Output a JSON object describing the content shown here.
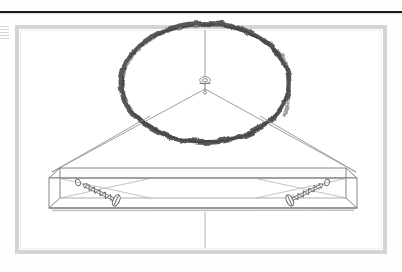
{
  "document": {
    "kind": "scanned-assembly-instruction-page",
    "title": "Hanging Shelf Mounting Diagram",
    "background_color": "#fefefe",
    "ink_color": "#7a7a7a",
    "annotation_color": "#4a4a4a",
    "rule_color": "#1c1c1c",
    "frame_color": "#d2d2d2"
  },
  "header_rule": {
    "name": "top-horizontal-rule",
    "x1": 0,
    "y1": 12,
    "x2": 402,
    "y2": 12,
    "thickness": 2.2,
    "color": "#1c1c1c"
  },
  "margin_marks": {
    "name": "left-margin-fragment",
    "visible": true,
    "lines": 5,
    "color": "#8d8d8d"
  },
  "illustration_frame": {
    "name": "illustration-border",
    "x": 17,
    "y": 27,
    "width": 368,
    "height": 225,
    "border_width": 4,
    "border_color": "#d4d4d4",
    "inner_fill": "#ffffff"
  },
  "annotation_circle": {
    "name": "hand-drawn-highlight-circle",
    "description": "dark hand-drawn ellipse encircling the suspension hook",
    "center_x": 205,
    "center_y": 83,
    "radius_x": 84,
    "radius_y": 60,
    "stroke_color": "#4d4d4d",
    "stroke_width": 5
  },
  "suspension": {
    "name": "suspension-assembly",
    "cable_color": "#8a8a8a",
    "vertical_cable": {
      "x": 205,
      "y_top": 30,
      "y_bottom": 78
    },
    "hook_fitting": {
      "name": "eye-bolt-fitting",
      "center_x": 205,
      "center_y": 81,
      "ring_rx": 5.2,
      "ring_ry": 3.6,
      "shaft_length": 12
    },
    "left_cable": {
      "x1": 205,
      "y1": 88,
      "x2": 52,
      "y2": 172
    },
    "right_cable": {
      "x1": 205,
      "y1": 88,
      "x2": 356,
      "y2": 172
    },
    "drop_line": {
      "x": 205,
      "y_top": 212,
      "y_bottom": 248
    }
  },
  "board": {
    "name": "shelf-board",
    "description": "isometric rectangular board viewed from slightly below",
    "front_face": {
      "x": 49,
      "y": 178,
      "width": 308,
      "height": 30
    },
    "top_face_depth": 10,
    "left_end_x": 49,
    "right_end_x": 357,
    "top_y": 168,
    "bottom_y": 209,
    "stroke_color": "#7d7d7d",
    "stroke_width": 0.9
  },
  "screws": [
    {
      "name": "screw-left",
      "pilot_hole_x": 78,
      "pilot_hole_y": 182,
      "head_x": 117,
      "head_y": 201,
      "tip_x": 86,
      "tip_y": 185,
      "angle_deg": 26,
      "length": 34,
      "thread_turns": 9,
      "color": "#6f6f6f"
    },
    {
      "name": "screw-right",
      "pilot_hole_x": 327,
      "pilot_hole_y": 182,
      "head_x": 289,
      "head_y": 201,
      "tip_x": 320,
      "tip_y": 185,
      "angle_deg": 154,
      "length": 34,
      "thread_turns": 9,
      "color": "#6f6f6f"
    }
  ],
  "guide_lines": {
    "name": "internal-guide-lines",
    "description": "faint diagonal construction lines inside the board outline",
    "color": "#9a9a9a"
  }
}
